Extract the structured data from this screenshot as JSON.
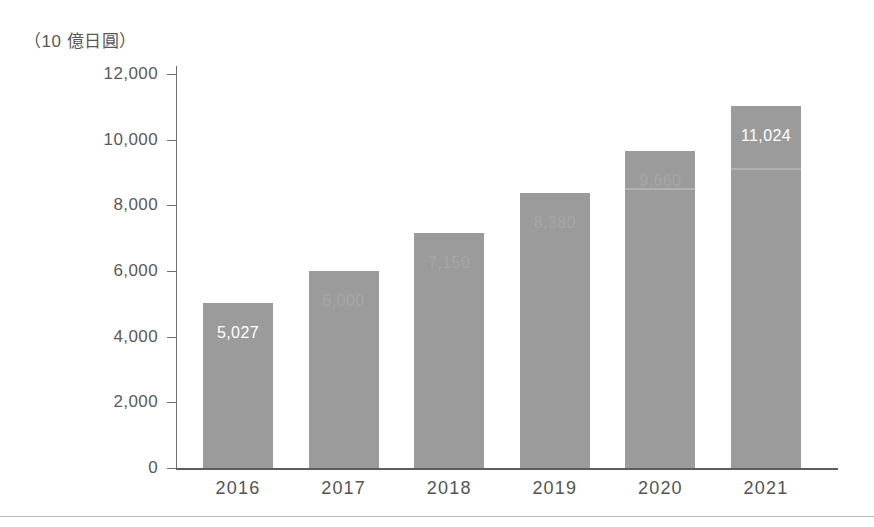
{
  "figure": {
    "unit_caption": "（10 億日圓）",
    "background_color": "#ffffff",
    "bar_color": "#9b9b9b",
    "axis_color": "#6f6f6f",
    "text_color": "#5a5a5a",
    "label_color": "#ffffff"
  },
  "chart_data": {
    "type": "bar",
    "title": "",
    "subtitle": "",
    "xlabel": "",
    "ylabel": "（10 億日圓）",
    "categories": [
      "2016",
      "2017",
      "2018",
      "2019",
      "2020",
      "2021"
    ],
    "values": [
      5027,
      6000,
      7150,
      8380,
      9660,
      11024
    ],
    "value_labels": [
      "5,027",
      "6,000",
      "7,150",
      "8,380",
      "9,660",
      "11,024"
    ],
    "value_labels_visible": [
      true,
      false,
      false,
      false,
      false,
      true
    ],
    "ylim": [
      0,
      12000
    ],
    "ytick_values": [
      0,
      2000,
      4000,
      6000,
      8000,
      10000,
      12000
    ],
    "ytick_labels": [
      "0",
      "2,000",
      "4,000",
      "6,000",
      "8,000",
      "10,000",
      "12,000"
    ],
    "grid": false,
    "legend": null,
    "legend_position": "none",
    "series": [
      {
        "name": "",
        "values": [
          5027,
          6000,
          7150,
          8380,
          9660,
          11024
        ]
      }
    ]
  }
}
